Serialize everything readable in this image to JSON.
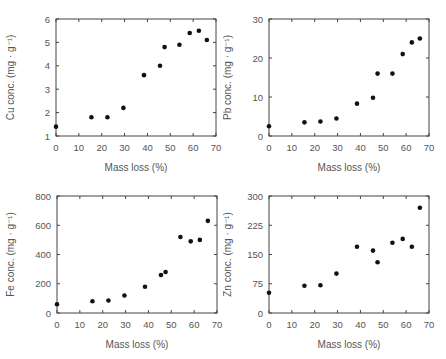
{
  "chart_data": [
    {
      "type": "scatter",
      "id": "cu",
      "title": "",
      "xlabel": "Mass loss (%)",
      "ylabel": "Cu conc. (mg · g⁻¹)",
      "xlim": [
        0,
        70
      ],
      "ylim": [
        1,
        6
      ],
      "xticks": [
        0,
        10,
        20,
        30,
        40,
        50,
        60,
        70
      ],
      "yticks": [
        1,
        2,
        3,
        4,
        5,
        6
      ],
      "grid": false,
      "x": [
        0,
        15.5,
        22.5,
        29.5,
        38.5,
        45.5,
        47.5,
        54,
        58.5,
        62.5,
        66
      ],
      "y": [
        1.4,
        1.8,
        1.8,
        2.2,
        3.6,
        4.0,
        4.8,
        4.9,
        5.4,
        5.5,
        5.1
      ]
    },
    {
      "type": "scatter",
      "id": "pb",
      "title": "",
      "xlabel": "Mass loss (%)",
      "ylabel": "Pb conc. (mg · g⁻¹)",
      "xlim": [
        0,
        70
      ],
      "ylim": [
        0,
        30
      ],
      "xticks": [
        0,
        10,
        20,
        30,
        40,
        50,
        60,
        70
      ],
      "yticks": [
        0,
        10,
        20,
        30
      ],
      "grid": false,
      "x": [
        0,
        15.5,
        22.5,
        29.5,
        38.5,
        45.5,
        47.5,
        54,
        58.5,
        62.5,
        66
      ],
      "y": [
        2.5,
        3.5,
        3.7,
        4.5,
        8.3,
        9.8,
        16,
        16,
        21,
        24,
        25
      ]
    },
    {
      "type": "scatter",
      "id": "fe",
      "title": "",
      "xlabel": "Mass loss (%)",
      "ylabel": "Fe conc. (mg · g⁻¹)",
      "xlim": [
        0,
        70
      ],
      "ylim": [
        0,
        800
      ],
      "xticks": [
        0,
        10,
        20,
        30,
        40,
        50,
        60,
        70
      ],
      "yticks": [
        0,
        200,
        400,
        600,
        800
      ],
      "grid": false,
      "x": [
        0,
        15.5,
        22.5,
        29.5,
        38.5,
        45.5,
        47.5,
        54,
        58.5,
        62.5,
        66
      ],
      "y": [
        60,
        80,
        85,
        120,
        180,
        260,
        280,
        520,
        490,
        500,
        630
      ]
    },
    {
      "type": "scatter",
      "id": "zn",
      "title": "",
      "xlabel": "Mass loss (%)",
      "ylabel": "Zn conc. (mg · g⁻¹)",
      "xlim": [
        0,
        70
      ],
      "ylim": [
        0,
        300
      ],
      "xticks": [
        0,
        10,
        20,
        30,
        40,
        50,
        60,
        70
      ],
      "yticks": [
        0,
        75,
        150,
        225,
        300
      ],
      "grid": false,
      "x": [
        0,
        15.5,
        22.5,
        29.5,
        38.5,
        45.5,
        47.5,
        54,
        58.5,
        62.5,
        66
      ],
      "y": [
        52,
        70,
        71,
        101,
        170,
        160,
        130,
        180,
        190,
        170,
        270
      ]
    }
  ],
  "colors": {
    "axis": "#444444",
    "marker": "#111111",
    "text": "#555555"
  }
}
